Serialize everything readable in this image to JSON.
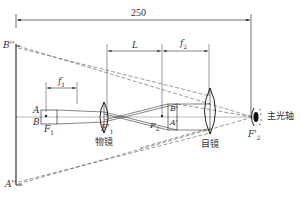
{
  "diagram": {
    "dimensions": {
      "total": "250",
      "L": "L",
      "f1": "f",
      "f1_sub": "1",
      "f2": "f",
      "f2_sub": "2"
    },
    "points": {
      "B_double_prime": "B''",
      "A_double_prime": "A''",
      "A": "A",
      "B": "B",
      "F1": "F",
      "F1_sub": "1",
      "F1_prime": "F'",
      "F1_prime_sub": "1",
      "F2": "F",
      "F2_sub": "2",
      "F2_prime": "F'",
      "F2_prime_sub": "2",
      "B_prime": "B'",
      "A_prime": "A'"
    },
    "labels": {
      "objective": "物镜",
      "eyepiece": "目镜",
      "optical_axis": "主光轴"
    },
    "colors": {
      "line": "#333333",
      "axis": "#888888",
      "background": "#ffffff"
    }
  }
}
